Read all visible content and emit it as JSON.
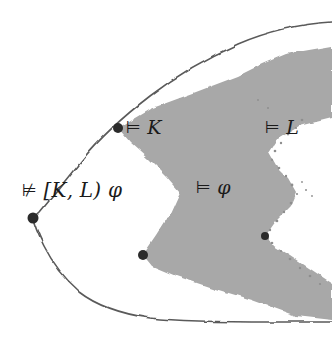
{
  "figure": {
    "kind": "hand-drawn-mathematical-diagram",
    "title": "",
    "width": 332,
    "height": 349,
    "background_color": "#ffffff",
    "ink_color": "#4a4a4a",
    "region_fill_color": "#a8a8a8",
    "dot_color": "#2b2b2b"
  },
  "labels": {
    "models_k": "⊨ K",
    "models_l": "⊨ L",
    "models_phi": "⊨ φ",
    "not_models_kl_phi": "⊭ [K, L) φ"
  },
  "labels_parts": {
    "models_k_turnstile": "⊨",
    "models_k_formula": "K",
    "models_l_turnstile": "⊨",
    "models_l_formula": "L",
    "models_phi_turnstile": "⊨",
    "models_phi_formula": "φ",
    "not_models_turnstile": "⊭",
    "not_models_formula": "[K, L) φ"
  },
  "points": [
    {
      "name": "point-models-k",
      "x": 118,
      "y": 128,
      "r": 5.0
    },
    {
      "name": "point-not-models-kl",
      "x": 33,
      "y": 218,
      "r": 5.5
    },
    {
      "name": "point-lower-left-gray",
      "x": 143,
      "y": 255,
      "r": 5.0
    },
    {
      "name": "point-right-gray",
      "x": 265,
      "y": 236,
      "r": 4.0
    }
  ],
  "shapes": {
    "outer_curve_name": "outer-boundary-curve",
    "gray_region_name": "shaded-region"
  }
}
